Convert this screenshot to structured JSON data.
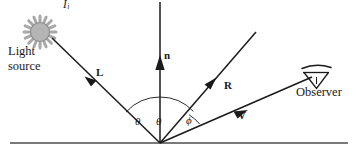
{
  "diagram": {
    "background_color": "#ffffff",
    "line_color": "#1a1a1a",
    "sun_fill_color": "#b3b3b3",
    "sun_stroke_color": "#808080",
    "ground_line_color": "#4d4d4d",
    "labels": {
      "intensity_symbol": "I",
      "intensity_subscript": "i",
      "light_source_line1": "Light",
      "light_source_line2": "source",
      "vector_L": "L",
      "vector_n": "n",
      "vector_R": "R",
      "vector_V": "V",
      "angle_theta_incident": "θ",
      "angle_theta_reflected": "θ",
      "angle_phi": "ϕ",
      "observer": "Observer"
    },
    "geometry": {
      "vertex": [
        160,
        143
      ],
      "ground_line": {
        "x1": 10,
        "y1": 143,
        "x2": 348,
        "y2": 143
      },
      "normal_ray": {
        "x1": 160,
        "y1": 143,
        "x2": 160,
        "y2": 2
      },
      "normal_arrow_tip": [
        160,
        58
      ],
      "light_ray": {
        "x1": 160,
        "y1": 143,
        "x2": 52,
        "y2": 38
      },
      "light_arrow_tip": [
        86,
        78
      ],
      "reflect_ray": {
        "x1": 160,
        "y1": 143,
        "x2": 256,
        "y2": 32
      },
      "reflect_arrow_tip": [
        213,
        81
      ],
      "view_ray": {
        "x1": 160,
        "y1": 143,
        "x2": 312,
        "y2": 77
      },
      "view_arrow_tip": [
        243,
        113
      ],
      "sun_center": [
        40,
        32
      ],
      "sun_inner_radius": 9,
      "sun_outer_radius": 15,
      "sun_ray_count": 16,
      "observer_eye_center": [
        316,
        78
      ],
      "arc_theta_incident_radius": 44,
      "arc_theta_reflected_radius": 44,
      "arc_phi_radius": 40
    }
  }
}
